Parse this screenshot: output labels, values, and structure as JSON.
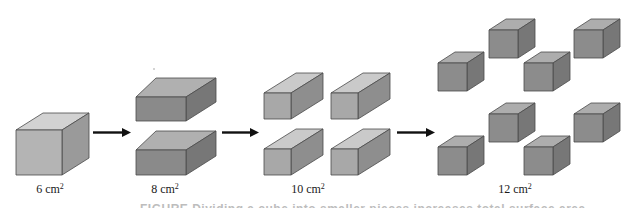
{
  "figure": {
    "stages": [
      {
        "id": "stage-1",
        "value": "6",
        "unit": "cm",
        "exponent": "2",
        "label": "6 cm²",
        "pieces": 1,
        "shape": "cube"
      },
      {
        "id": "stage-2",
        "value": "8",
        "unit": "cm",
        "exponent": "2",
        "label": "8 cm²",
        "pieces": 2,
        "shape": "slab"
      },
      {
        "id": "stage-3",
        "value": "10",
        "unit": "cm",
        "exponent": "2",
        "label": "10 cm²",
        "pieces": 4,
        "shape": "bar"
      },
      {
        "id": "stage-4",
        "value": "12",
        "unit": "cm",
        "exponent": "2",
        "label": "12 cm²",
        "pieces": 8,
        "shape": "small-cube"
      }
    ],
    "arrows": [
      {
        "from": "stage-1",
        "to": "stage-2",
        "icon": "right-arrow-icon"
      },
      {
        "from": "stage-2",
        "to": "stage-3",
        "icon": "right-arrow-icon"
      },
      {
        "from": "stage-3",
        "to": "stage-4",
        "icon": "right-arrow-icon"
      }
    ],
    "caption": "FIGURE  Dividing a cube into smaller pieces increases total surface area"
  },
  "colors": {
    "cube_light_front": "#b4b4b4",
    "cube_light_top": "#d2d2d2",
    "cube_light_side": "#9a9a9a",
    "slab_front": "#8a8a8a",
    "slab_top": "#b0b0b0",
    "slab_side": "#777777",
    "bar_front": "#a8a8a8",
    "bar_top": "#cacaca",
    "bar_side": "#8e8e8e",
    "small_front": "#8c8c8c",
    "small_top": "#adadad",
    "small_side": "#777777",
    "edge": "#4a4a4a",
    "arrow": "#111111"
  }
}
